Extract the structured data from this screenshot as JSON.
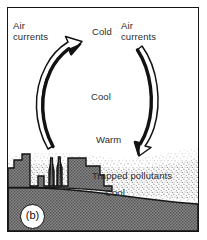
{
  "figure": {
    "panel_label": "(b)",
    "type": "temperature-inversion-diagram"
  },
  "labels": {
    "air_currents_left_line1": "Air",
    "air_currents_left_line2": "currents",
    "air_currents_right_line1": "Air",
    "air_currents_right_line2": "currents",
    "cold": "Cold",
    "cool_middle": "Cool",
    "warm": "Warm",
    "trapped_pollutants": "Trapped pollutants",
    "cool_lower": "Cool"
  },
  "icons": {
    "left_arrow": "curved-up-arrow-icon",
    "right_arrow": "curved-down-arrow-icon",
    "skyline": "city-skyline-icon",
    "smokestacks": "smokestack-icon",
    "haze": "pollution-haze-icon"
  },
  "colors": {
    "ink": "#141414",
    "text": "#2b2b2b",
    "ground_fill": "#7f7f7f",
    "haze_fill": "#f2f2f2",
    "paper": "#ffffff"
  }
}
